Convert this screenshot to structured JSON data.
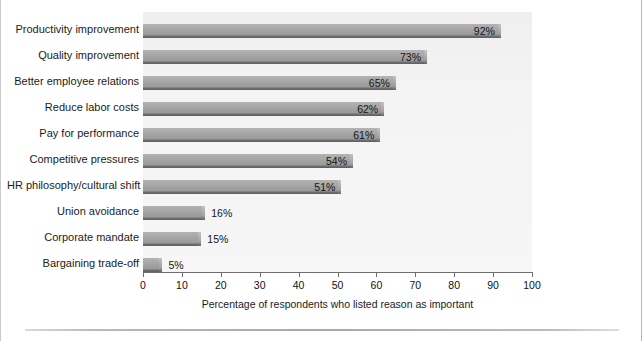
{
  "chart_data": {
    "type": "bar",
    "orientation": "horizontal",
    "title": "",
    "xlabel": "Percentage of respondents who listed reason as important",
    "ylabel": "",
    "xlim": [
      0,
      100
    ],
    "xticks": [
      0,
      10,
      20,
      30,
      40,
      50,
      60,
      70,
      80,
      90,
      100
    ],
    "grid": false,
    "legend": null,
    "categories": [
      "Productivity improvement",
      "Quality improvement",
      "Better employee relations",
      "Reduce labor costs",
      "Pay for performance",
      "Competitive pressures",
      "HR philosophy/cultural shift",
      "Union avoidance",
      "Corporate mandate",
      "Bargaining trade-off"
    ],
    "values": [
      92,
      73,
      65,
      62,
      61,
      54,
      51,
      16,
      15,
      5
    ],
    "value_labels": [
      "92%",
      "73%",
      "65%",
      "62%",
      "61%",
      "54%",
      "51%",
      "16%",
      "15%",
      "5%"
    ],
    "label_placement": [
      "inside",
      "inside",
      "inside",
      "inside",
      "inside",
      "inside",
      "inside",
      "outside",
      "outside",
      "outside"
    ],
    "colors": {
      "bar_fill": "#a0a0a0",
      "bar_shadow": "#5f5f5f",
      "plot_background": "#f3f3f3",
      "axis": "#6d6d6d",
      "text": "#1b1b1b"
    }
  },
  "title_remnant": "",
  "xaxis": {
    "label": "Percentage of respondents who listed reason as important",
    "tick_labels": [
      "0",
      "10",
      "20",
      "30",
      "40",
      "50",
      "60",
      "70",
      "80",
      "90",
      "100"
    ]
  }
}
